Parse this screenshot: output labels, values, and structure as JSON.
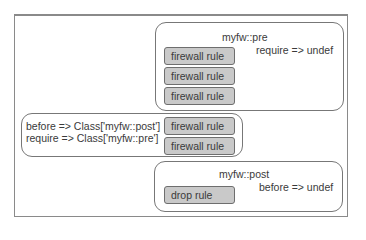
{
  "diagram": {
    "groups": {
      "pre": {
        "title": "myfw::pre",
        "param": "require => undef",
        "rules": [
          "firewall rule",
          "firewall rule",
          "firewall rule"
        ]
      },
      "main": {
        "param_before": "before => Class['myfw::post']",
        "param_require": "require => Class['myfw::pre']",
        "rules": [
          "firewall rule",
          "firewall rule"
        ]
      },
      "post": {
        "title": "myfw::post",
        "param": "before => undef",
        "rules": [
          "drop rule"
        ]
      }
    },
    "colors": {
      "rule_fill": "#c9c9c9",
      "border": "#777777",
      "text": "#3a3a3a"
    }
  }
}
